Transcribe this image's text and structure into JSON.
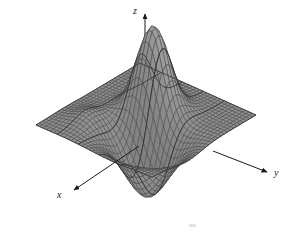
{
  "figure": {
    "kind": "3d-surface-mesh-plot",
    "background_color": "#ffffff",
    "width": 291,
    "height": 234
  },
  "axes": {
    "x": {
      "label": "x",
      "arrow_direction": "down-left",
      "tail": [
        139,
        146
      ],
      "head": [
        71,
        192
      ]
    },
    "y": {
      "label": "y",
      "arrow_direction": "right",
      "tail": [
        213,
        151
      ],
      "head": [
        270,
        173
      ]
    },
    "z": {
      "label": "z",
      "arrow_direction": "up",
      "tail": [
        145,
        140
      ],
      "head": [
        145,
        12
      ]
    }
  },
  "style": {
    "surface_fill_light": "#b0b0b0",
    "surface_fill_dark": "#8a8a8a",
    "mesh_line_color": "#4a4a4a",
    "silhouette_color": "#3a3a3a",
    "axis_color": "#1a1a1a",
    "label_color": "#1a1a1a"
  },
  "chart_data": {
    "type": "surface",
    "title": "",
    "xlabel": "x",
    "ylabel": "y",
    "zlabel": "z",
    "grid": true,
    "legend": null,
    "xlim": [
      -3,
      3
    ],
    "ylim": [
      -3,
      3
    ],
    "zlim": [
      -0.7,
      1.0
    ],
    "nx": 34,
    "ny": 34,
    "function": "z = 0.95*exp(-((x+0.55)^2 + (y+0.15)^2)*1.15) - 0.62*exp(-((x-0.95)^2*0.8 + (y-0.9)^2*0.55)) + 0.10*exp(-((x-1.4)^2 + (y+1.6)^2)*1.4)",
    "features": [
      {
        "name": "peak",
        "x": -0.55,
        "y": -0.15,
        "z": 0.95
      },
      {
        "name": "valley",
        "x": 0.95,
        "y": 0.9,
        "z": -0.62
      },
      {
        "name": "saddle",
        "x": 0.2,
        "y": 0.35,
        "z": 0.05
      }
    ],
    "projection": {
      "type": "oblique",
      "azimuth_deg": -38,
      "elevation_deg": 22
    }
  }
}
